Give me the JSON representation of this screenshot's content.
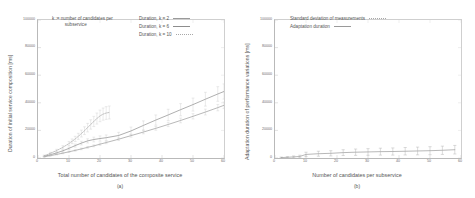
{
  "figure": {
    "panels": [
      {
        "id": "a",
        "caption": "(a)",
        "annotation": "k := number of candidates per\n          subservice",
        "chart_data": {
          "type": "line",
          "title": "",
          "xlabel": "Total number of candidates of the composite service",
          "ylabel": "Duration of initial service composition [ms]",
          "xlim": [
            0,
            60
          ],
          "ylim": [
            0,
            100000
          ],
          "xticks": [
            0,
            10,
            20,
            30,
            40,
            50,
            60
          ],
          "xticklabels": [
            "0",
            "10",
            "20",
            "30",
            "40",
            "50",
            "60"
          ],
          "yticks": [
            0,
            20000,
            40000,
            60000,
            80000,
            100000
          ],
          "yticklabels": [
            "0",
            "20000",
            "40000",
            "60000",
            "80000",
            "100000"
          ],
          "grid": false,
          "legend_position": "top-right",
          "errorbars": true,
          "series": [
            {
              "name": "Duration, k = 2",
              "style": "solid",
              "color": "#9a9a9a",
              "x": [
                2,
                4,
                6,
                8,
                10,
                12,
                14,
                16,
                18,
                20,
                22,
                26,
                30,
                34,
                38,
                42,
                46,
                50,
                54,
                58,
                60
              ],
              "y": [
                900,
                1700,
                2600,
                3500,
                4500,
                5500,
                6600,
                7700,
                8800,
                10000,
                11200,
                13600,
                16200,
                18800,
                21500,
                24300,
                27200,
                30200,
                33300,
                36500,
                38200
              ],
              "yerr": [
                300,
                350,
                400,
                450,
                500,
                550,
                600,
                650,
                700,
                800,
                850,
                950,
                1100,
                1250,
                1400,
                1550,
                1700,
                1900,
                2100,
                2300,
                2400
              ]
            },
            {
              "name": "Duration, k = 6",
              "style": "solid",
              "color": "#8d8d8d",
              "x": [
                2,
                4,
                6,
                8,
                10,
                12,
                14,
                16,
                18,
                20,
                22,
                26,
                30,
                34,
                38,
                42,
                46,
                50,
                54,
                58,
                60
              ],
              "y": [
                1200,
                2400,
                3700,
                5200,
                7000,
                9000,
                10800,
                12400,
                13400,
                14100,
                14700,
                16300,
                19600,
                23600,
                27500,
                31200,
                35000,
                38700,
                42600,
                46400,
                48200
              ],
              "yerr": [
                400,
                500,
                600,
                700,
                900,
                1100,
                1300,
                1500,
                1700,
                1900,
                2000,
                2300,
                2800,
                3300,
                3700,
                4100,
                4400,
                4700,
                5000,
                5300,
                5500
              ]
            },
            {
              "name": "Duration, k = 10",
              "style": "dotted",
              "color": "#a8a8a8",
              "x": [
                2,
                4,
                6,
                8,
                10,
                11,
                12,
                13,
                14,
                15,
                16,
                17,
                18,
                19,
                20,
                21,
                22,
                23
              ],
              "y": [
                1600,
                3400,
                5400,
                7700,
                10500,
                12100,
                13800,
                15700,
                17700,
                19800,
                22000,
                24300,
                26500,
                28600,
                30500,
                31800,
                32600,
                33000
              ],
              "yerr": [
                500,
                700,
                900,
                1200,
                1500,
                1700,
                1900,
                2200,
                2500,
                2800,
                3100,
                3400,
                3700,
                4000,
                4200,
                4400,
                4600,
                4700
              ]
            }
          ]
        }
      },
      {
        "id": "b",
        "caption": "(b)",
        "annotation": "",
        "chart_data": {
          "type": "line",
          "title": "",
          "xlabel": "Number of candidates per subservice",
          "ylabel": "Adaptation duration of performance variations [ms]",
          "xlim": [
            0,
            60
          ],
          "ylim": [
            0,
            100000
          ],
          "xticks": [
            0,
            10,
            20,
            30,
            40,
            50,
            60
          ],
          "xticklabels": [
            "0",
            "10",
            "20",
            "30",
            "40",
            "50",
            "60"
          ],
          "yticks": [
            0,
            20000,
            40000,
            60000,
            80000,
            100000
          ],
          "yticklabels": [
            "0",
            "20000",
            "40000",
            "60000",
            "80000",
            "100000"
          ],
          "grid": false,
          "legend_position": "top-center",
          "errorbars": true,
          "series": [
            {
              "name": "Standard deviation of measurements",
              "style": "errorbar",
              "color": "#b0b0b0",
              "x": [
                2,
                4,
                6,
                8,
                10,
                14,
                18,
                22,
                26,
                30,
                34,
                38,
                42,
                46,
                50,
                54,
                58
              ],
              "y": [
                300,
                500,
                800,
                1100,
                2600,
                3100,
                3400,
                3900,
                4200,
                4400,
                4600,
                4700,
                4900,
                5100,
                5300,
                5600,
                6000
              ],
              "yerr": [
                400,
                500,
                700,
                900,
                1600,
                1800,
                1900,
                2100,
                2300,
                2400,
                2500,
                2600,
                2700,
                2800,
                2900,
                3000,
                3100
              ]
            },
            {
              "name": "Adaptation duration",
              "style": "solid",
              "color": "#9a9a9a",
              "x": [
                2,
                4,
                6,
                8,
                10,
                14,
                18,
                22,
                26,
                30,
                34,
                38,
                42,
                46,
                50,
                54,
                58
              ],
              "y": [
                300,
                500,
                800,
                1100,
                2600,
                3100,
                3400,
                3900,
                4200,
                4400,
                4600,
                4700,
                4900,
                5100,
                5300,
                5600,
                6000
              ],
              "yerr": [
                0,
                0,
                0,
                0,
                0,
                0,
                0,
                0,
                0,
                0,
                0,
                0,
                0,
                0,
                0,
                0,
                0
              ]
            }
          ]
        }
      }
    ]
  }
}
